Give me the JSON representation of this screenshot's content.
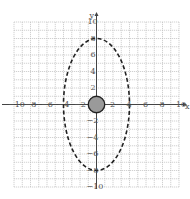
{
  "chart_data": {
    "type": "scatter",
    "title": "",
    "xlabel": "x",
    "ylabel": "y",
    "xlim": [
      -10,
      10
    ],
    "ylim": [
      -10,
      10
    ],
    "grid": true,
    "grid_step": 1,
    "x_ticks": [
      -10,
      -8,
      -6,
      -4,
      -2,
      2,
      4,
      6,
      8,
      10
    ],
    "y_ticks": [
      10,
      8,
      6,
      4,
      2,
      -2,
      -4,
      -6,
      -8,
      -10
    ],
    "shapes": [
      {
        "name": "dashed-ellipse",
        "kind": "ellipse",
        "center": [
          0,
          0
        ],
        "rx": 4,
        "ry": 8,
        "style": "dashed",
        "stroke": "#222222"
      },
      {
        "name": "filled-circle",
        "kind": "circle",
        "center": [
          0,
          0
        ],
        "r": 1,
        "fill": "#9a9a9a",
        "stroke": "#222222"
      }
    ]
  },
  "colors": {
    "grid": "#bdbdbd",
    "axis": "#444444",
    "ellipse": "#222222",
    "circle_fill": "#9a9a9a",
    "text": "#555555"
  }
}
